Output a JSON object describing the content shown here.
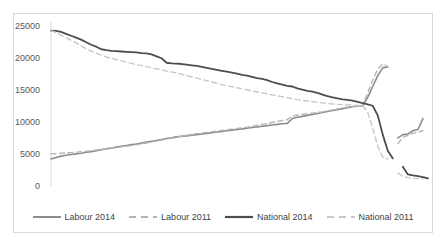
{
  "chart_data": {
    "type": "line",
    "title": "",
    "subtitle": "",
    "xlabel": "",
    "ylabel": "",
    "xlim": [
      0,
      71
    ],
    "ylim": [
      0,
      25000
    ],
    "grid": false,
    "legend_position": "bottom",
    "x_axis_visible": false,
    "y_ticks": [
      0,
      5000,
      10000,
      15000,
      20000,
      25000
    ],
    "y_tick_labels": [
      "0",
      "5000",
      "10000",
      "15000",
      "20000",
      "25000"
    ],
    "series": [
      {
        "name": "Labour 2014",
        "color": "#8c8c8c",
        "style": "solid",
        "width": 1.6,
        "values": [
          4200,
          4450,
          4650,
          4800,
          4900,
          5000,
          5100,
          5250,
          5350,
          5500,
          5650,
          5800,
          5900,
          6050,
          6200,
          6300,
          6450,
          6550,
          6700,
          6850,
          6950,
          7100,
          7250,
          7400,
          7500,
          7650,
          7750,
          7800,
          7900,
          8000,
          8100,
          8200,
          8300,
          8400,
          8500,
          8600,
          8700,
          8800,
          8900,
          9000,
          9100,
          9200,
          9300,
          9400,
          9500,
          9600,
          9700,
          9750,
          10500,
          10700,
          10850,
          11000,
          11150,
          11300,
          11450,
          11600,
          11750,
          11900,
          12050,
          12200,
          12350,
          12450,
          12500,
          13800,
          15500,
          17200,
          18400,
          18550,
          null,
          7500,
          8000,
          8100,
          8600,
          8800,
          10500
        ]
      },
      {
        "name": "Labour 2011",
        "color": "#b4b4b4",
        "style": "dashed",
        "width": 1.4,
        "values": [
          5000,
          5050,
          5100,
          5150,
          5200,
          5280,
          5350,
          5420,
          5500,
          5600,
          5700,
          5800,
          5900,
          6000,
          6100,
          6200,
          6300,
          6420,
          6550,
          6700,
          6850,
          7000,
          7150,
          7300,
          7450,
          7600,
          7750,
          7900,
          8050,
          8150,
          8250,
          8350,
          8450,
          8550,
          8650,
          8750,
          8850,
          8950,
          9050,
          9150,
          9300,
          9450,
          9600,
          9750,
          9900,
          10050,
          10200,
          10350,
          10900,
          11050,
          11150,
          11250,
          11350,
          11450,
          11550,
          11700,
          11850,
          12000,
          12150,
          12300,
          12400,
          12480,
          12520,
          14500,
          16500,
          18200,
          19000,
          18600,
          null,
          6600,
          7600,
          7900,
          8200,
          8400,
          8600
        ]
      },
      {
        "name": "National 2014",
        "color": "#4d4d4d",
        "style": "solid",
        "width": 1.8,
        "values": [
          24200,
          24150,
          24000,
          23700,
          23400,
          23100,
          22800,
          22400,
          22000,
          21700,
          21300,
          21150,
          21050,
          21000,
          20950,
          20900,
          20850,
          20800,
          20700,
          20650,
          20500,
          20200,
          19900,
          19200,
          19100,
          19050,
          19000,
          18900,
          18800,
          18700,
          18550,
          18400,
          18250,
          18100,
          17950,
          17800,
          17650,
          17500,
          17300,
          17200,
          17000,
          16800,
          16700,
          16500,
          16200,
          16000,
          15800,
          15600,
          15500,
          15200,
          15000,
          14800,
          14700,
          14500,
          14250,
          14000,
          13800,
          13650,
          13500,
          13400,
          13300,
          13100,
          12900,
          12700,
          12500,
          11000,
          8000,
          5500,
          4300,
          null,
          3000,
          1800,
          1650,
          1550,
          1400,
          1200
        ]
      },
      {
        "name": "National 2011",
        "color": "#c8c8c8",
        "style": "dashed",
        "width": 1.4,
        "values": [
          24200,
          23900,
          23500,
          23100,
          22700,
          22300,
          21800,
          21400,
          21000,
          20700,
          20400,
          20100,
          19900,
          19700,
          19500,
          19300,
          19100,
          18900,
          18750,
          18600,
          18400,
          18250,
          18100,
          17900,
          17750,
          17600,
          17400,
          17200,
          17000,
          16800,
          16600,
          16400,
          16200,
          16000,
          15800,
          15600,
          15450,
          15300,
          15150,
          15000,
          14800,
          14650,
          14500,
          14350,
          14200,
          14050,
          13900,
          13750,
          13600,
          13450,
          13350,
          13250,
          13150,
          13050,
          12950,
          12850,
          12780,
          12720,
          12680,
          12640,
          12600,
          12560,
          12520,
          11500,
          9000,
          6200,
          4500,
          4200,
          null,
          2000,
          1500,
          1300,
          1200,
          1150,
          1100
        ]
      }
    ]
  },
  "legend": {
    "entries": [
      {
        "label": "Labour 2014",
        "color": "#8c8c8c",
        "style": "solid"
      },
      {
        "label": "Labour 2011",
        "color": "#b4b4b4",
        "style": "dashed"
      },
      {
        "label": "National 2014",
        "color": "#4d4d4d",
        "style": "solid"
      },
      {
        "label": "National 2011",
        "color": "#c8c8c8",
        "style": "dashed"
      }
    ]
  },
  "axis": {
    "y_labels": [
      "25000",
      "20000",
      "15000",
      "10000",
      "5000",
      "0"
    ]
  }
}
